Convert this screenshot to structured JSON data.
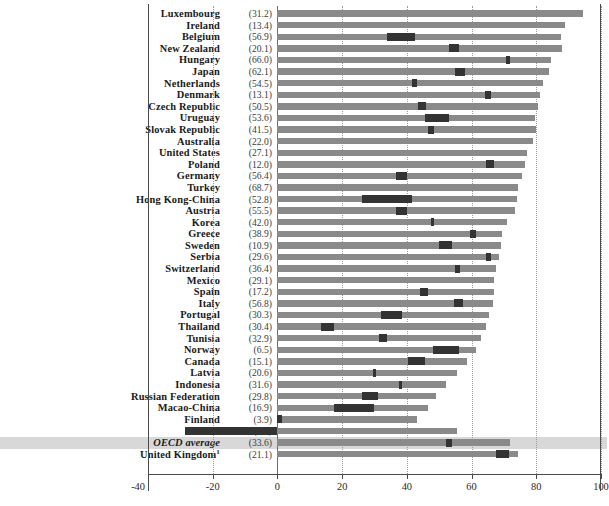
{
  "chart_data": {
    "type": "bar",
    "orientation": "horizontal",
    "title": "",
    "subtitle": "",
    "xlabel": "",
    "ylabel": "",
    "xlim": [
      -40,
      100
    ],
    "xticks": [
      -40,
      -20,
      0,
      20,
      40,
      60,
      80,
      100
    ],
    "xtick_labels": [
      "-40",
      "-20",
      "0",
      "20",
      "40",
      "60",
      "80",
      "100"
    ],
    "grid": "vertical-dotted",
    "legend": [],
    "annotations": [],
    "note": "Each row shows a light-grey total bar with an embedded darker segment positioned within it.",
    "categories": [
      "Luxembourg",
      "Ireland",
      "Belgium",
      "New Zealand",
      "Hungary",
      "Japan",
      "Netherlands",
      "Denmark",
      "Czech Republic",
      "Uruguay",
      "Slovak Republic",
      "Australia",
      "United States",
      "Poland",
      "Germany",
      "Turkey",
      "Hong Kong-China",
      "Austria",
      "Korea",
      "Greece",
      "Sweden",
      "Serbia",
      "Switzerland",
      "Mexico",
      "Spain",
      "Italy",
      "Portugal",
      "Thailand",
      "Tunisia",
      "Norway",
      "Canada",
      "Latvia",
      "Indonesia",
      "Russian Federation",
      "Macao-China",
      "Finland",
      "Iceland",
      "OECD average",
      "United Kingdom"
    ],
    "paren_values": [
      31.2,
      13.4,
      56.9,
      20.1,
      66.0,
      62.1,
      54.5,
      13.1,
      50.5,
      53.6,
      41.5,
      22.0,
      27.1,
      12.0,
      56.4,
      68.7,
      52.8,
      55.5,
      42.0,
      38.9,
      10.9,
      29.6,
      36.4,
      29.1,
      17.2,
      56.8,
      30.3,
      30.4,
      32.9,
      6.5,
      15.1,
      20.6,
      31.6,
      29.8,
      16.9,
      3.9,
      3.6,
      33.6,
      21.1
    ],
    "rows": [
      {
        "label": "Luxembourg",
        "paren": "(31.2)",
        "bar_start": 0,
        "bar_end": 94.5,
        "seg_start": null,
        "seg_end": null
      },
      {
        "label": "Ireland",
        "paren": "(13.4)",
        "bar_start": 0,
        "bar_end": 89.0,
        "seg_start": null,
        "seg_end": null
      },
      {
        "label": "Belgium",
        "paren": "(56.9)",
        "bar_start": 0,
        "bar_end": 87.5,
        "seg_start": 34.0,
        "seg_end": 42.5
      },
      {
        "label": "New Zealand",
        "paren": "(20.1)",
        "bar_start": 0,
        "bar_end": 88.0,
        "seg_start": 53.0,
        "seg_end": 56.0
      },
      {
        "label": "Hungary",
        "paren": "(66.0)",
        "bar_start": 0,
        "bar_end": 84.5,
        "seg_start": 70.5,
        "seg_end": 72.0
      },
      {
        "label": "Japan",
        "paren": "(62.1)",
        "bar_start": 0,
        "bar_end": 84.0,
        "seg_start": 55.0,
        "seg_end": 58.0
      },
      {
        "label": "Netherlands",
        "paren": "(54.5)",
        "bar_start": 0,
        "bar_end": 82.0,
        "seg_start": 41.5,
        "seg_end": 43.0
      },
      {
        "label": "Denmark",
        "paren": "(13.1)",
        "bar_start": 0,
        "bar_end": 81.0,
        "seg_start": 64.0,
        "seg_end": 66.0
      },
      {
        "label": "Czech Republic",
        "paren": "(50.5)",
        "bar_start": 0,
        "bar_end": 80.5,
        "seg_start": 43.5,
        "seg_end": 46.0
      },
      {
        "label": "Uruguay",
        "paren": "(53.6)",
        "bar_start": 0,
        "bar_end": 79.5,
        "seg_start": 45.5,
        "seg_end": 53.0
      },
      {
        "label": "Slovak Republic",
        "paren": "(41.5)",
        "bar_start": 0,
        "bar_end": 80.0,
        "seg_start": 46.5,
        "seg_end": 48.5
      },
      {
        "label": "Australia",
        "paren": "(22.0)",
        "bar_start": 0,
        "bar_end": 79.0,
        "seg_start": null,
        "seg_end": null
      },
      {
        "label": "United States",
        "paren": "(27.1)",
        "bar_start": 0,
        "bar_end": 77.0,
        "seg_start": null,
        "seg_end": null
      },
      {
        "label": "Poland",
        "paren": "(12.0)",
        "bar_start": 0,
        "bar_end": 76.5,
        "seg_start": 64.5,
        "seg_end": 67.0
      },
      {
        "label": "Germany",
        "paren": "(56.4)",
        "bar_start": 0,
        "bar_end": 75.5,
        "seg_start": 36.5,
        "seg_end": 40.0
      },
      {
        "label": "Turkey",
        "paren": "(68.7)",
        "bar_start": 0,
        "bar_end": 74.5,
        "seg_start": null,
        "seg_end": null
      },
      {
        "label": "Hong Kong-China",
        "paren": "(52.8)",
        "bar_start": 0,
        "bar_end": 74.0,
        "seg_start": 26.0,
        "seg_end": 41.5
      },
      {
        "label": "Austria",
        "paren": "(55.5)",
        "bar_start": 0,
        "bar_end": 73.5,
        "seg_start": 36.5,
        "seg_end": 40.0
      },
      {
        "label": "Korea",
        "paren": "(42.0)",
        "bar_start": 0,
        "bar_end": 71.0,
        "seg_start": 47.5,
        "seg_end": 48.5
      },
      {
        "label": "Greece",
        "paren": "(38.9)",
        "bar_start": 0,
        "bar_end": 69.5,
        "seg_start": 59.5,
        "seg_end": 61.5
      },
      {
        "label": "Sweden",
        "paren": "(10.9)",
        "bar_start": 0,
        "bar_end": 69.0,
        "seg_start": 50.0,
        "seg_end": 54.0
      },
      {
        "label": "Serbia",
        "paren": "(29.6)",
        "bar_start": 0,
        "bar_end": 68.5,
        "seg_start": 64.5,
        "seg_end": 66.0
      },
      {
        "label": "Switzerland",
        "paren": "(36.4)",
        "bar_start": 0,
        "bar_end": 67.5,
        "seg_start": 55.0,
        "seg_end": 56.5
      },
      {
        "label": "Mexico",
        "paren": "(29.1)",
        "bar_start": 0,
        "bar_end": 67.0,
        "seg_start": null,
        "seg_end": null
      },
      {
        "label": "Spain",
        "paren": "(17.2)",
        "bar_start": 0,
        "bar_end": 67.0,
        "seg_start": 44.0,
        "seg_end": 46.5
      },
      {
        "label": "Italy",
        "paren": "(56.8)",
        "bar_start": 0,
        "bar_end": 66.5,
        "seg_start": 54.5,
        "seg_end": 57.5
      },
      {
        "label": "Portugal",
        "paren": "(30.3)",
        "bar_start": 0,
        "bar_end": 65.5,
        "seg_start": 32.0,
        "seg_end": 38.5
      },
      {
        "label": "Thailand",
        "paren": "(30.4)",
        "bar_start": 0,
        "bar_end": 64.5,
        "seg_start": 13.5,
        "seg_end": 17.5
      },
      {
        "label": "Tunisia",
        "paren": "(32.9)",
        "bar_start": 0,
        "bar_end": 63.0,
        "seg_start": 31.5,
        "seg_end": 34.0
      },
      {
        "label": "Norway",
        "paren": "(6.5)",
        "bar_start": 0,
        "bar_end": 61.5,
        "seg_start": 48.0,
        "seg_end": 56.0
      },
      {
        "label": "Canada",
        "paren": "(15.1)",
        "bar_start": 0,
        "bar_end": 58.5,
        "seg_start": 40.5,
        "seg_end": 45.5
      },
      {
        "label": "Latvia",
        "paren": "(20.6)",
        "bar_start": 0,
        "bar_end": 55.5,
        "seg_start": 29.5,
        "seg_end": 30.5
      },
      {
        "label": "Indonesia",
        "paren": "(31.6)",
        "bar_start": 0,
        "bar_end": 52.0,
        "seg_start": 37.5,
        "seg_end": 38.5
      },
      {
        "label": "Russian Federation",
        "paren": "(29.8)",
        "bar_start": 0,
        "bar_end": 49.0,
        "seg_start": 26.0,
        "seg_end": 31.0
      },
      {
        "label": "Macao-China",
        "paren": "(16.9)",
        "bar_start": 0,
        "bar_end": 46.5,
        "seg_start": 17.5,
        "seg_end": 30.0
      },
      {
        "label": "Finland",
        "paren": "(3.9)",
        "bar_start": 0,
        "bar_end": 43.0,
        "seg_start": 0.0,
        "seg_end": 1.5
      },
      {
        "label": "Iceland",
        "paren": "(3.6)",
        "bar_start": -28.5,
        "bar_end": 55.5,
        "seg_start": -28.5,
        "seg_end": 0.0
      },
      {
        "label": "OECD average",
        "paren": "(33.6)",
        "bar_start": 0,
        "bar_end": 72.0,
        "seg_start": 52.0,
        "seg_end": 54.0,
        "highlight": true
      },
      {
        "label": "United Kingdom",
        "paren": "(21.1)",
        "bar_start": 0,
        "bar_end": 74.5,
        "seg_start": 67.5,
        "seg_end": 71.5,
        "superscript": "1"
      }
    ]
  },
  "style": {
    "bar_color": "#8a8a8a",
    "segment_color": "#333333",
    "highlight_band_color": "#d8d8d8",
    "grid_color": "#9a9a9a",
    "axis_color": "#4a4a4a",
    "background": "#ffffff"
  }
}
